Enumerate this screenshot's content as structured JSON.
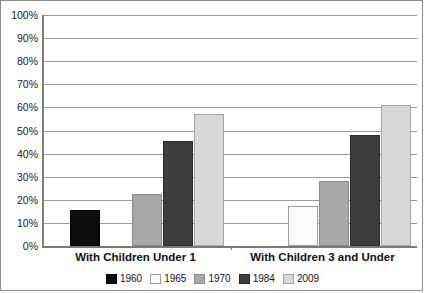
{
  "chart_data": {
    "type": "bar",
    "title": "",
    "subtitle": "",
    "xlabel": "",
    "ylabel": "",
    "categories": [
      "With Children Under 1",
      "With Children 3 and Under"
    ],
    "series": [
      {
        "name": "1960",
        "color": "#0d0d0d",
        "values": [
          15.5,
          null
        ]
      },
      {
        "name": "1965",
        "color": "#fbfbfb",
        "values": [
          null,
          17.5
        ]
      },
      {
        "name": "1970",
        "color": "#a8a8a8",
        "values": [
          22.5,
          28
        ]
      },
      {
        "name": "1984",
        "color": "#3d3d3d",
        "values": [
          45.5,
          48
        ]
      },
      {
        "name": "2009",
        "color": "#d8d8d8",
        "values": [
          57,
          61
        ]
      }
    ],
    "ylim": [
      0,
      100
    ],
    "ytick_step": 10,
    "ytick_labels": [
      "100%",
      "90%",
      "80%",
      "70%",
      "60%",
      "50%",
      "40%",
      "30%",
      "20%",
      "10%",
      "0%"
    ],
    "grid": true,
    "grid_axis": "y",
    "legend_position": "bottom"
  },
  "axis": {
    "y_ticks": [
      {
        "label": "100%",
        "value": 100
      },
      {
        "label": "90%",
        "value": 90
      },
      {
        "label": "80%",
        "value": 80
      },
      {
        "label": "70%",
        "value": 70
      },
      {
        "label": "60%",
        "value": 60
      },
      {
        "label": "50%",
        "value": 50
      },
      {
        "label": "40%",
        "value": 40
      },
      {
        "label": "30%",
        "value": 30
      },
      {
        "label": "20%",
        "value": 20
      },
      {
        "label": "10%",
        "value": 10
      },
      {
        "label": "0%",
        "value": 0
      }
    ]
  },
  "legend": {
    "items": [
      {
        "label": "1960",
        "swatch": "c1960"
      },
      {
        "label": "1965",
        "swatch": "c1965"
      },
      {
        "label": "1970",
        "swatch": "c1970"
      },
      {
        "label": "1984",
        "swatch": "c1984"
      },
      {
        "label": "2009",
        "swatch": "c2009"
      }
    ]
  }
}
